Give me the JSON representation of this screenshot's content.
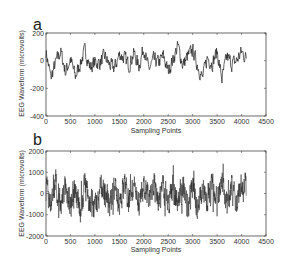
{
  "chart_data": [
    {
      "panel": "a",
      "type": "line",
      "title": "",
      "xlabel": "Sampling Points",
      "ylabel": "EEG Waveform (microvolts)",
      "xlim": [
        0,
        4500
      ],
      "ylim": [
        -400,
        200
      ],
      "xticks": [
        0,
        500,
        1000,
        1500,
        2000,
        2500,
        3000,
        3500,
        4000,
        4500
      ],
      "yticks": [
        -400,
        -200,
        0,
        200
      ],
      "n_points": 4097,
      "line_color": "#222222",
      "grid": false,
      "approx_range": [
        -250,
        190
      ],
      "samples": {
        "x": [
          0,
          100,
          200,
          300,
          400,
          500,
          600,
          700,
          800,
          900,
          1000,
          1100,
          1200,
          1300,
          1400,
          1500,
          1600,
          1700,
          1800,
          1900,
          2000,
          2100,
          2200,
          2300,
          2400,
          2500,
          2600,
          2700,
          2800,
          2900,
          3000,
          3100,
          3200,
          3300,
          3400,
          3500,
          3600,
          3700,
          3800,
          3900,
          4000,
          4097
        ],
        "y": [
          120,
          -230,
          -20,
          120,
          -150,
          20,
          -210,
          -40,
          140,
          -90,
          -20,
          -30,
          60,
          -60,
          -100,
          80,
          40,
          -60,
          100,
          -80,
          180,
          -120,
          10,
          -30,
          60,
          -140,
          20,
          190,
          -60,
          60,
          140,
          -60,
          -230,
          40,
          -40,
          120,
          -240,
          60,
          -40,
          0,
          120,
          30
        ]
      }
    },
    {
      "panel": "b",
      "type": "line",
      "title": "",
      "xlabel": "Sampling Points",
      "ylabel": "EEG Waveform (microvolts)",
      "xlim": [
        0,
        4500
      ],
      "ylim": [
        -2000,
        2000
      ],
      "xticks": [
        0,
        500,
        1000,
        1500,
        2000,
        2500,
        3000,
        3500,
        4000,
        4500
      ],
      "yticks": [
        -2000,
        -1000,
        0,
        1000,
        2000
      ],
      "n_points": 4097,
      "line_color": "#222222",
      "grid": false,
      "approx_range": [
        -1800,
        1400
      ],
      "samples": {
        "x": [
          0,
          100,
          200,
          300,
          400,
          500,
          600,
          700,
          800,
          900,
          1000,
          1100,
          1200,
          1300,
          1400,
          1500,
          1600,
          1700,
          1800,
          1900,
          2000,
          2100,
          2200,
          2300,
          2400,
          2500,
          2600,
          2700,
          2800,
          2900,
          3000,
          3100,
          3200,
          3300,
          3400,
          3500,
          3600,
          3700,
          3800,
          3900,
          4000,
          4097
        ],
        "y": [
          500,
          -1200,
          900,
          -800,
          600,
          -1000,
          300,
          -1600,
          1000,
          -900,
          -1700,
          800,
          200,
          -1400,
          600,
          -900,
          1000,
          -600,
          400,
          -1200,
          900,
          -800,
          1300,
          -1000,
          500,
          -1100,
          700,
          -900,
          1100,
          -1500,
          800,
          -1800,
          600,
          -700,
          1200,
          -1000,
          1300,
          -1600,
          900,
          -1100,
          1000,
          300
        ]
      }
    }
  ],
  "panels": {
    "a": {
      "letter": "a",
      "ylabel": "EEG Waveform (microvolts)",
      "xlabel": "Sampling Points",
      "xtick_labels": [
        "0",
        "500",
        "1000",
        "1500",
        "2000",
        "2500",
        "3000",
        "3500",
        "4000",
        "4500"
      ],
      "ytick_labels": [
        "200",
        "0",
        "-200",
        "-400"
      ]
    },
    "b": {
      "letter": "b",
      "ylabel": "EEG Waveform (microvolts)",
      "xlabel": "Sampling Points",
      "xtick_labels": [
        "0",
        "500",
        "1000",
        "1500",
        "2000",
        "2500",
        "3000",
        "3500",
        "4000",
        "4500"
      ],
      "ytick_labels": [
        "2000",
        "1000",
        "0",
        "-1000",
        "-2000"
      ]
    }
  }
}
